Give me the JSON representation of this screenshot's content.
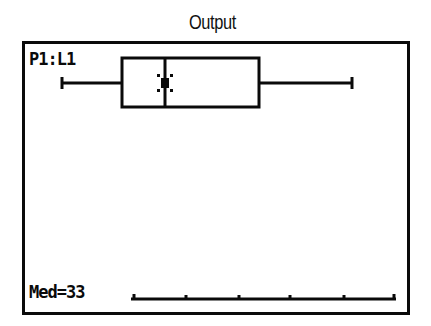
{
  "title": "Output",
  "calculator_screen": {
    "plot_label": "P1:L1",
    "trace_readout": "Med=33",
    "colors": {
      "ink": "#0a0a0a",
      "background": "#ffffff"
    }
  },
  "boxplot": {
    "type": "modified-boxplot",
    "median": 33,
    "whisker_left_px": 62,
    "q1_px": 122,
    "median_px": 165,
    "q3_px": 259,
    "whisker_right_px": 352,
    "axis_ticks_px": [
      134,
      186,
      239,
      290,
      344,
      394
    ]
  }
}
